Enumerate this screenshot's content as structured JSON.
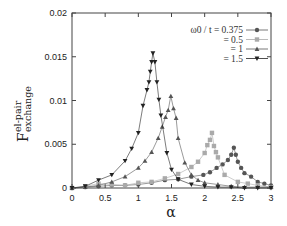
{
  "chart_data": {
    "type": "line",
    "title": "",
    "xlabel": "α",
    "ylabel": "F^{el-pair}_{exchange}",
    "ylabel_parts": {
      "base": "F",
      "sup": "el-pair",
      "sub": "exchange"
    },
    "xlim": [
      0,
      3
    ],
    "ylim": [
      0,
      0.02
    ],
    "x_ticks": [
      "0",
      "0.5",
      "1",
      "1.5",
      "2",
      "2.5",
      "3"
    ],
    "y_ticks": [
      "0",
      "0.005",
      "0.01",
      "0.015",
      "0.02"
    ],
    "grid": false,
    "legend_position": "upper right",
    "legend_title": "ω0 / t",
    "series": [
      {
        "name": "ω0 / t = 0.375",
        "legend_label": "ω0 / t = 0.375",
        "marker": "circle",
        "color": "#555555",
        "x": [
          0,
          0.2,
          0.4,
          0.6,
          0.8,
          1.0,
          1.2,
          1.4,
          1.6,
          1.8,
          1.98,
          2.08,
          2.18,
          2.27,
          2.35,
          2.4,
          2.44,
          2.47,
          2.5,
          2.55,
          2.6,
          2.7,
          2.8,
          2.9,
          3.0
        ],
        "y": [
          0,
          0.0001,
          0.0002,
          0.0003,
          0.0003,
          0.0004,
          0.0006,
          0.0009,
          0.001,
          0.0013,
          0.0015,
          0.0018,
          0.0023,
          0.0027,
          0.0032,
          0.0038,
          0.0046,
          0.0038,
          0.003,
          0.0023,
          0.0017,
          0.0013,
          0.0007,
          0.0005,
          0.0003
        ]
      },
      {
        "name": "ω0 / t = 0.5",
        "legend_label": "= 0.5",
        "marker": "square",
        "color": "#aaaaaa",
        "x": [
          0,
          0.2,
          0.4,
          0.6,
          0.8,
          1.0,
          1.2,
          1.4,
          1.6,
          1.8,
          1.9,
          2.0,
          2.04,
          2.08,
          2.11,
          2.14,
          2.17,
          2.2,
          2.3,
          2.5,
          2.65,
          2.8,
          3.0
        ],
        "y": [
          0,
          0.0002,
          0.0005,
          0.0004,
          0.0003,
          0.0006,
          0.0007,
          0.0011,
          0.0016,
          0.0024,
          0.003,
          0.004,
          0.0049,
          0.0055,
          0.0063,
          0.0048,
          0.0041,
          0.0035,
          0.0015,
          0.0007,
          0.0005,
          0.0003,
          0.0001
        ]
      },
      {
        "name": "ω0 / t = 1",
        "legend_label": "= 1",
        "marker": "triangle-up",
        "color": "#555555",
        "x": [
          0,
          0.2,
          0.4,
          0.6,
          0.8,
          1.0,
          1.1,
          1.2,
          1.3,
          1.36,
          1.41,
          1.45,
          1.49,
          1.53,
          1.57,
          1.6,
          1.7,
          1.8,
          1.9,
          2.0,
          2.2,
          2.4,
          2.6,
          2.8,
          3.0
        ],
        "y": [
          0,
          0.0001,
          0.0003,
          0.0007,
          0.0013,
          0.0023,
          0.0031,
          0.0041,
          0.0057,
          0.007,
          0.0081,
          0.0089,
          0.0105,
          0.0091,
          0.008,
          0.0057,
          0.0029,
          0.0015,
          0.0009,
          0.0006,
          0.0004,
          0.0002,
          0.0001,
          0.0001,
          0.0001
        ]
      },
      {
        "name": "ω0 / t = 1.5",
        "legend_label": "= 1.5",
        "marker": "triangle-down",
        "color": "#222222",
        "x": [
          0,
          0.2,
          0.4,
          0.6,
          0.8,
          0.9,
          1.0,
          1.07,
          1.13,
          1.16,
          1.18,
          1.2,
          1.22,
          1.25,
          1.28,
          1.31,
          1.34,
          1.43,
          1.5,
          1.6,
          1.8,
          2.0,
          2.2,
          2.4,
          2.6,
          2.8,
          3.0
        ],
        "y": [
          0,
          0.0002,
          0.0009,
          0.0015,
          0.0031,
          0.0045,
          0.0063,
          0.0094,
          0.0112,
          0.0121,
          0.0133,
          0.0144,
          0.0154,
          0.0144,
          0.0121,
          0.0101,
          0.0083,
          0.004,
          0.0021,
          0.001,
          0.0004,
          0.0002,
          0.0001,
          0.0001,
          0.0,
          0.0,
          0.0
        ]
      }
    ]
  }
}
